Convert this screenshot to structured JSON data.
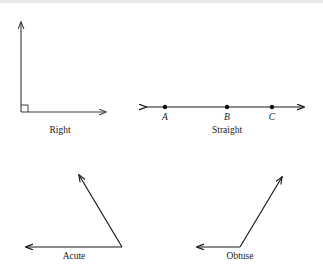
{
  "figure": {
    "background_color": "#ffffff",
    "stroke_color": "#3a3a3a",
    "label_color": "#1a1a1a",
    "panels": [
      {
        "id": "right",
        "label": "Right",
        "label_x": 60,
        "label_y": 133,
        "vertex": {
          "x": 21,
          "y": 112
        },
        "rays": [
          {
            "name": "vertical-ray",
            "to_x": 21,
            "to_y": 20
          },
          {
            "name": "horizontal-ray",
            "to_x": 108,
            "to_y": 112
          }
        ],
        "marker": "right-angle-square",
        "marker_size": 7
      },
      {
        "id": "straight",
        "label": "Straight",
        "label_x": 227,
        "label_y": 133,
        "line": {
          "x1": 140,
          "y1": 107,
          "x2": 310,
          "y2": 107
        },
        "double_arrow": true,
        "points": [
          {
            "name": "A",
            "x": 165,
            "y": 107,
            "label_y": 120
          },
          {
            "name": "B",
            "x": 227,
            "y": 107,
            "label_y": 120
          },
          {
            "name": "C",
            "x": 272,
            "y": 107,
            "label_y": 120
          }
        ]
      },
      {
        "id": "acute",
        "label": "Acute",
        "label_x": 74,
        "label_y": 259,
        "vertex": {
          "x": 122,
          "y": 247
        },
        "rays": [
          {
            "name": "left-ray",
            "to_x": 21,
            "to_y": 247
          },
          {
            "name": "upper-left-ray",
            "to_x": 76,
            "to_y": 170
          }
        ]
      },
      {
        "id": "obtuse",
        "label": "Obtuse",
        "label_x": 240,
        "label_y": 259,
        "vertex": {
          "x": 240,
          "y": 247
        },
        "rays": [
          {
            "name": "left-ray",
            "to_x": 192,
            "to_y": 247
          },
          {
            "name": "upper-right-ray",
            "to_x": 285,
            "to_y": 172
          }
        ]
      }
    ]
  }
}
